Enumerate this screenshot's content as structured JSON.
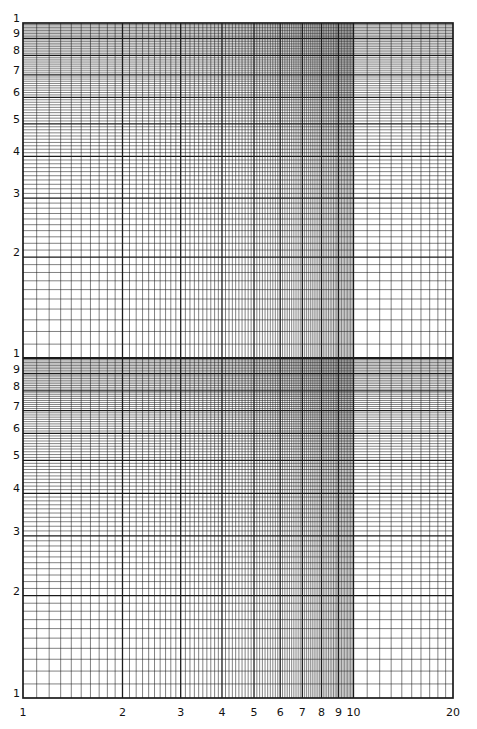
{
  "chart_data": {
    "type": "line",
    "title": "",
    "subtitle": "Log-log graph paper (blank)",
    "xlabel": "",
    "ylabel": "",
    "x_scale": "log",
    "y_scale": "log",
    "x_range": [
      1,
      20
    ],
    "y_cycles": 2,
    "x_tick_labels": [
      "1",
      "2",
      "3",
      "4",
      "5",
      "6",
      "7",
      "8",
      "9",
      "10",
      "20"
    ],
    "x_tick_values": [
      1,
      2,
      3,
      4,
      5,
      6,
      7,
      8,
      9,
      10,
      20
    ],
    "y_tick_labels_per_cycle": [
      "1",
      "2",
      "3",
      "4",
      "5",
      "6",
      "7",
      "8",
      "9"
    ],
    "y_top_label": "1",
    "grid": true,
    "minor_subdivisions_per_unit": 10,
    "series": [],
    "legend": null
  },
  "style": {
    "line_color": "#1a1a1a",
    "major_width": 1.3,
    "minor_width": 0.55,
    "background": "#ffffff"
  },
  "layout": {
    "left": 23,
    "right": 453,
    "top": 23,
    "mid": 358,
    "bottom": 698
  }
}
